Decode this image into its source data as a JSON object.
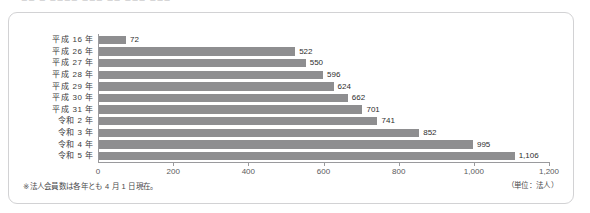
{
  "header": {
    "cropped_text": "— ■■ ■  ■■■■ ■■■  ■■  ■■■  ■■■"
  },
  "footnote": "※法人会員数は各年とも 4 月 1 日現在。",
  "unit_note": "（単位：法人）",
  "colors": {
    "bar": "#8e8e90",
    "axis": "#9a9a9d",
    "card_border": "#d2d2d4",
    "text": "#3c3c3c",
    "background": "#ffffff"
  },
  "chart_data": {
    "type": "bar",
    "orientation": "horizontal",
    "title": "",
    "xlabel": "",
    "ylabel": "",
    "xlim": [
      0,
      1200
    ],
    "grid": false,
    "legend": null,
    "value_unit": "法人",
    "xticks": [
      0,
      200,
      400,
      600,
      800,
      1000,
      1200
    ],
    "xtick_labels": [
      "0",
      "200",
      "400",
      "600",
      "800",
      "1,000",
      "1,200"
    ],
    "categories": [
      "平成 16 年",
      "平成 26 年",
      "平成 27 年",
      "平成 28 年",
      "平成 29 年",
      "平成 30 年",
      "平成 31 年",
      "令和 2 年",
      "令和 3 年",
      "令和 4 年",
      "令和 5 年"
    ],
    "values": [
      72,
      522,
      550,
      596,
      624,
      662,
      701,
      741,
      852,
      995,
      1106
    ],
    "value_labels": [
      "72",
      "522",
      "550",
      "596",
      "624",
      "662",
      "701",
      "741",
      "852",
      "995",
      "1,106"
    ]
  }
}
